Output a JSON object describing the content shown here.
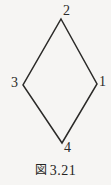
{
  "figure": {
    "caption_kanji": "図",
    "caption_number": "3.21",
    "caption_full": "図 3.21",
    "shape_name": "rhombus",
    "line_color": "#2b2a28",
    "background_color": "#f6f5f3",
    "vertices": [
      {
        "id": "v2",
        "label": "2",
        "position": "top",
        "x": 61,
        "y": 19
      },
      {
        "id": "v1",
        "label": "1",
        "position": "right",
        "x": 97,
        "y": 84
      },
      {
        "id": "v4",
        "label": "4",
        "position": "bottom",
        "x": 62,
        "y": 143
      },
      {
        "id": "v3",
        "label": "3",
        "position": "left",
        "x": 23,
        "y": 85
      }
    ],
    "edges": [
      {
        "id": "edge-2-3",
        "from": "v2",
        "to": "v3"
      },
      {
        "id": "edge-2-1",
        "from": "v2",
        "to": "v1"
      },
      {
        "id": "edge-3-4",
        "from": "v3",
        "to": "v4"
      },
      {
        "id": "edge-1-4",
        "from": "v1",
        "to": "v4"
      }
    ]
  }
}
